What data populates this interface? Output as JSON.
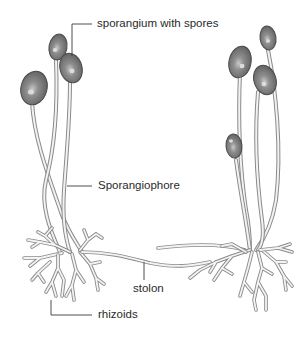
{
  "diagram": {
    "labels": {
      "sporangium": "sporangium with spores",
      "sporangiophore": "Sporangiophore",
      "stolon": "stolon",
      "rhizoids": "rhizoids"
    },
    "colors": {
      "background": "#ffffff",
      "outline": "#8a8a8a",
      "sporangium_fill": "#7d7d7d",
      "sporangium_highlight": "#d9d9d9",
      "text": "#2a2a2a",
      "leader_line": "#3a3a3a"
    },
    "structures": [
      {
        "name": "left-colony",
        "sporangia_count": 3
      },
      {
        "name": "right-colony",
        "sporangia_count": 4
      }
    ]
  }
}
